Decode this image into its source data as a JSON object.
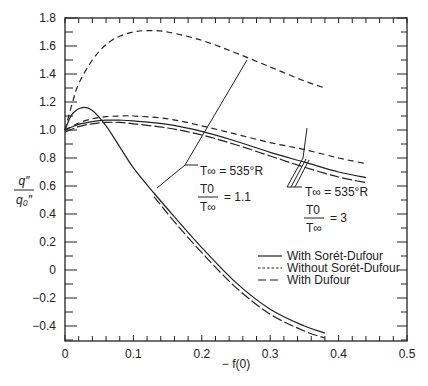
{
  "chart_data": {
    "type": "line",
    "title": "",
    "xlabel": "−f(0)",
    "ylabel": "q″ / q₀″",
    "xlim": [
      0,
      0.5
    ],
    "ylim": [
      -0.5,
      1.8
    ],
    "x_ticks": [
      "0",
      "0.1",
      "0.2",
      "0.3",
      "0.4",
      "0.5"
    ],
    "y_ticks": [
      "−0.4",
      "−0.2",
      "0",
      "0.2",
      "0.4",
      "0.6",
      "0.8",
      "1.0",
      "1.2",
      "1.4",
      "1.6",
      "1.8"
    ],
    "grid": false,
    "legend_position": "lower right (inside)",
    "legend": [
      {
        "label": "With Sorét-Dufour",
        "style": "solid"
      },
      {
        "label": "Without Sorét-Dufour",
        "style": "dotted"
      },
      {
        "label": "With Dufour",
        "style": "dashed"
      }
    ],
    "annotations": [
      {
        "text": "T∞ = 535°R",
        "ratio": "T0/T∞ = 1.1"
      },
      {
        "text": "T∞ = 535°R",
        "ratio": "T0/T∞ = 3"
      }
    ],
    "series": [
      {
        "name": "Without Sorét-Dufour, T0/T∞ = 3",
        "style": "dashed",
        "x": [
          0,
          0.01,
          0.02,
          0.04,
          0.06,
          0.08,
          0.1,
          0.12,
          0.15,
          0.2,
          0.25,
          0.3,
          0.35,
          0.38
        ],
        "y": [
          1.0,
          1.18,
          1.33,
          1.5,
          1.61,
          1.67,
          1.7,
          1.71,
          1.7,
          1.64,
          1.55,
          1.45,
          1.35,
          1.3
        ]
      },
      {
        "name": "Without Sorét-Dufour, T0/T∞ = 1.1",
        "style": "dashed",
        "x": [
          0,
          0.02,
          0.04,
          0.06,
          0.08,
          0.1,
          0.15,
          0.2,
          0.25,
          0.3,
          0.35,
          0.4,
          0.44
        ],
        "y": [
          1.0,
          1.05,
          1.08,
          1.095,
          1.1,
          1.1,
          1.08,
          1.03,
          0.97,
          0.91,
          0.86,
          0.8,
          0.76
        ]
      },
      {
        "name": "With Sorét-Dufour, T0/T∞ = 3",
        "style": "solid",
        "x": [
          0,
          0.02,
          0.04,
          0.06,
          0.08,
          0.1,
          0.15,
          0.2,
          0.25,
          0.3,
          0.35,
          0.4,
          0.44
        ],
        "y": [
          1.0,
          1.04,
          1.06,
          1.07,
          1.07,
          1.065,
          1.04,
          0.99,
          0.92,
          0.84,
          0.77,
          0.7,
          0.66
        ]
      },
      {
        "name": "With Dufour, T0/T∞ = 3",
        "style": "long-dash",
        "x": [
          0,
          0.02,
          0.04,
          0.06,
          0.08,
          0.1,
          0.15,
          0.2,
          0.25,
          0.3,
          0.35,
          0.4,
          0.44
        ],
        "y": [
          1.0,
          1.04,
          1.06,
          1.07,
          1.07,
          1.06,
          1.03,
          0.98,
          0.91,
          0.83,
          0.75,
          0.68,
          0.64
        ]
      },
      {
        "name": "With Sorét-Dufour, T0/T∞ = 1.1",
        "style": "solid",
        "x": [
          0,
          0.01,
          0.025,
          0.04,
          0.06,
          0.08,
          0.1,
          0.13,
          0.16,
          0.2,
          0.25,
          0.3,
          0.35,
          0.38
        ],
        "y": [
          1.0,
          1.11,
          1.16,
          1.14,
          1.03,
          0.88,
          0.73,
          0.55,
          0.38,
          0.16,
          -0.09,
          -0.28,
          -0.4,
          -0.45
        ]
      },
      {
        "name": "With Dufour, T0/T∞ = 1.1",
        "style": "long-dash",
        "x": [
          0.13,
          0.16,
          0.2,
          0.25,
          0.3,
          0.35,
          0.38
        ],
        "y": [
          0.54,
          0.36,
          0.14,
          -0.11,
          -0.3,
          -0.42,
          -0.47
        ]
      }
    ]
  },
  "axis": {
    "x_label": "− f(0)",
    "y_label_num": "q″",
    "y_label_den": "q₀″"
  },
  "annotations": {
    "a1_line1": "T∞  =  535°R",
    "a1_ratio_num": "T0",
    "a1_ratio_den": "T∞",
    "a1_ratio_val": "=  1.1",
    "a2_line1": "T∞  =  535°R",
    "a2_ratio_num": "T0",
    "a2_ratio_den": "T∞",
    "a2_ratio_val": "=  3"
  },
  "legend": {
    "item0": "With Sorét-Dufour",
    "item1": "Without Sorét-Dufour",
    "item2": "With Dufour"
  }
}
